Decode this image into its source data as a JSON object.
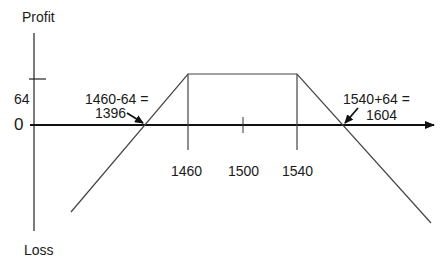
{
  "diagram": {
    "type": "payoff-diagram",
    "y_axis": {
      "top_label": "Profit",
      "bottom_label": "Loss"
    },
    "x_axis": {
      "zero_label": "0"
    },
    "y_ticks": [
      {
        "label": "64"
      }
    ],
    "x_ticks": [
      {
        "label": "1460"
      },
      {
        "label": "1500"
      },
      {
        "label": "1540"
      }
    ],
    "annotations": [
      {
        "line1": "1460-64 =",
        "line2": "1396"
      },
      {
        "line1": "1540+64 =",
        "line2": "1604"
      }
    ],
    "colors": {
      "axis": "#111111",
      "payoff": "#444444",
      "text": "#1a1a1a"
    }
  }
}
